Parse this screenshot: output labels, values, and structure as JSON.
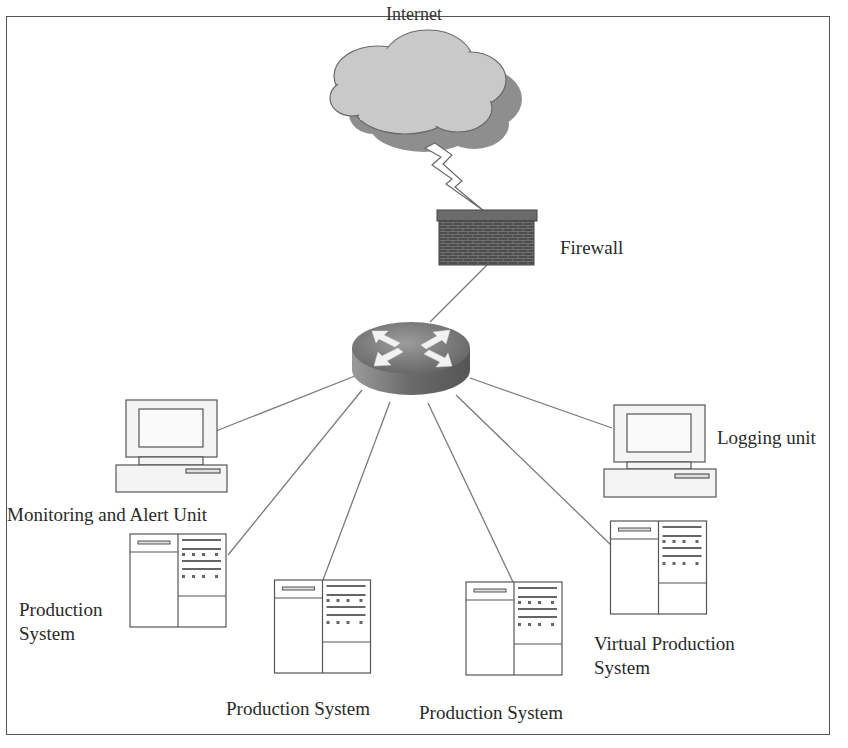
{
  "diagram": {
    "type": "network-topology",
    "colors": {
      "line": "#7a7a7a",
      "cloud_fill": "#c9c9c9",
      "cloud_shadow": "#8e8e8e",
      "firewall": "#555555",
      "router_top": "#8a8a8a",
      "router_side": "#6e6e6e",
      "device_fill": "#f4f4f4",
      "device_stroke": "#555555"
    },
    "nodes": {
      "internet": {
        "label": "Internet",
        "icon": "cloud-icon"
      },
      "firewall": {
        "label": "Firewall",
        "icon": "brick-wall-icon"
      },
      "router": {
        "label": "",
        "icon": "router-icon"
      },
      "monitoring": {
        "label": "Monitoring and Alert Unit",
        "icon": "desktop-computer-icon"
      },
      "logging": {
        "label": "Logging unit",
        "icon": "desktop-computer-icon"
      },
      "production_left": {
        "label_line1": "Production",
        "label_line2": "System",
        "icon": "server-icon"
      },
      "production_mid1": {
        "label": "Production System",
        "icon": "server-icon"
      },
      "production_mid2": {
        "label": "Production System",
        "icon": "server-icon"
      },
      "virtual_production": {
        "label_line1": "Virtual Production",
        "label_line2": "System",
        "icon": "server-icon"
      }
    },
    "edges": [
      {
        "from": "internet",
        "to": "firewall",
        "style": "lightning"
      },
      {
        "from": "firewall",
        "to": "router"
      },
      {
        "from": "router",
        "to": "monitoring"
      },
      {
        "from": "router",
        "to": "logging"
      },
      {
        "from": "router",
        "to": "production_left"
      },
      {
        "from": "router",
        "to": "production_mid1"
      },
      {
        "from": "router",
        "to": "production_mid2"
      },
      {
        "from": "router",
        "to": "virtual_production"
      }
    ]
  }
}
